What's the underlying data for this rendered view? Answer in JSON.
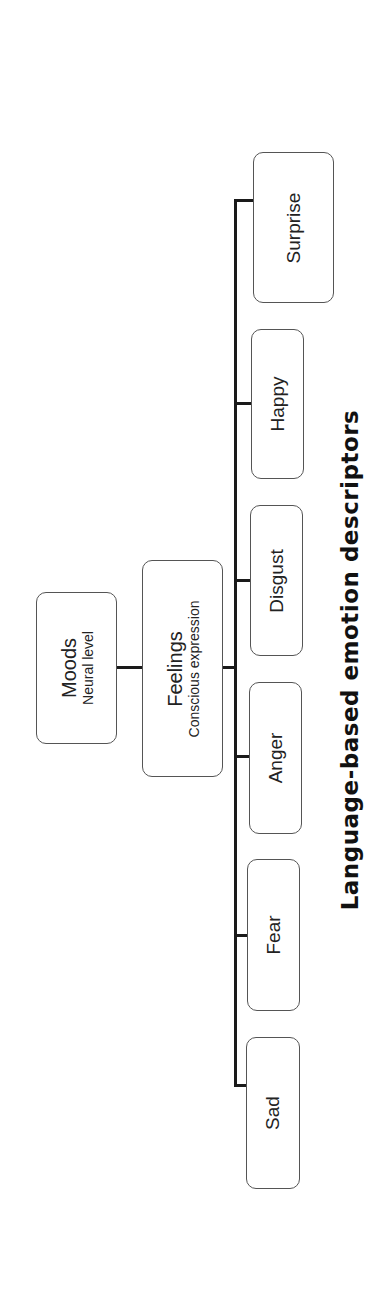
{
  "diagram": {
    "type": "hierarchy-tree",
    "orientation": "rotated-90-ccw",
    "root": {
      "title": "Moods",
      "subtitle": "Neural level"
    },
    "level2": {
      "title": "Feelings",
      "subtitle": "Conscious expression"
    },
    "leaves": [
      {
        "label": "Sad"
      },
      {
        "label": "Fear"
      },
      {
        "label": "Anger"
      },
      {
        "label": "Disgust"
      },
      {
        "label": "Happy"
      },
      {
        "label": "Surprise"
      }
    ],
    "caption": "Language-based emotion descriptors"
  }
}
